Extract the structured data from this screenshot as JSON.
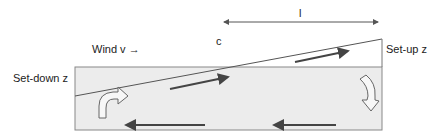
{
  "diagram": {
    "labels": {
      "wind": "Wind v →",
      "set_down": "Set-down z",
      "set_up": "Set-up z",
      "length": "l",
      "c": "c"
    },
    "colors": {
      "water_fill": "#ececec",
      "outline": "#777777",
      "arrow": "#444444",
      "text": "#222222"
    },
    "flows": [
      {
        "name": "surface-flow-left",
        "direction": "right"
      },
      {
        "name": "surface-flow-right",
        "direction": "right"
      },
      {
        "name": "return-flow-left",
        "direction": "left"
      },
      {
        "name": "return-flow-right",
        "direction": "left"
      },
      {
        "name": "upwelling-curved",
        "side": "left"
      },
      {
        "name": "downwelling-curved",
        "side": "right"
      }
    ]
  }
}
